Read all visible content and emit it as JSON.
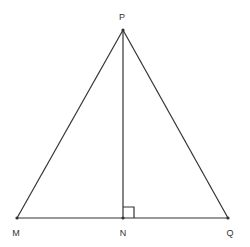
{
  "diagram": {
    "points": {
      "P": {
        "label": "P",
        "x": 123,
        "y": 30,
        "label_x": 122,
        "label_y": 20
      },
      "M": {
        "label": "M",
        "x": 17,
        "y": 218,
        "label_x": 16,
        "label_y": 236
      },
      "N": {
        "label": "N",
        "x": 123,
        "y": 218,
        "label_x": 123,
        "label_y": 236
      },
      "Q": {
        "label": "Q",
        "x": 228,
        "y": 218,
        "label_x": 230,
        "label_y": 236
      }
    },
    "segments": [
      {
        "from": "P",
        "to": "M"
      },
      {
        "from": "P",
        "to": "Q"
      },
      {
        "from": "M",
        "to": "Q"
      },
      {
        "from": "P",
        "to": "N"
      }
    ],
    "right_angle": {
      "at": "N",
      "size": 11
    },
    "colors": {
      "stroke": "#333333",
      "background": "#ffffff"
    }
  }
}
